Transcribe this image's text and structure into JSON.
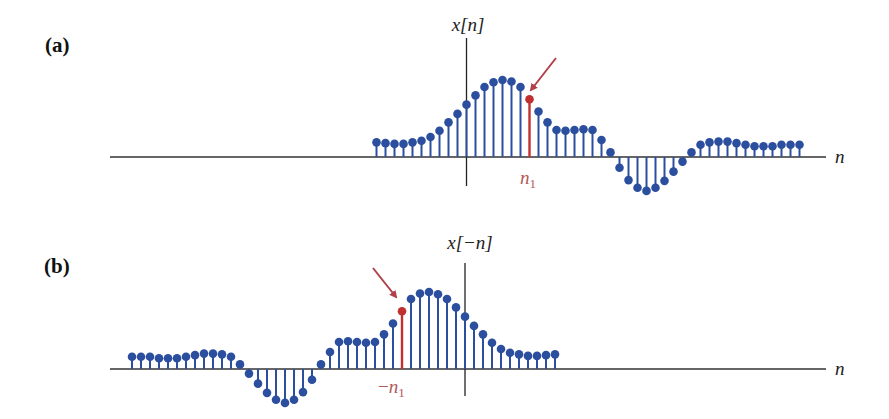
{
  "figure": {
    "panels": [
      {
        "id": "a",
        "label": "(a)",
        "ylabel": "x[n]",
        "xlabel": "n",
        "marker_label": "n",
        "marker_sub": "1",
        "marker_prefix": ""
      },
      {
        "id": "b",
        "label": "(b)",
        "ylabel": "x[−n]",
        "xlabel": "n",
        "marker_label": "n",
        "marker_sub": "1",
        "marker_prefix": "−"
      }
    ],
    "colors": {
      "stem": "#2b4f9e",
      "marker": "#c0302f",
      "axis": "#333333",
      "arrow": "#b0404a",
      "label_marker": "#b05a5a"
    }
  },
  "chart_data": [
    {
      "type": "stem",
      "title": "(a) x[n]",
      "xlabel": "n",
      "ylabel": "x[n]",
      "n": [
        -10,
        -9,
        -8,
        -7,
        -6,
        -5,
        -4,
        -3,
        -2,
        -1,
        0,
        1,
        2,
        3,
        4,
        5,
        6,
        7,
        8,
        9,
        10,
        11,
        12,
        13,
        14,
        15,
        16,
        17,
        18,
        19,
        20,
        21,
        22,
        23,
        24,
        25,
        26,
        27,
        28,
        29,
        30,
        31,
        32,
        33,
        34,
        35,
        36,
        37
      ],
      "values": [
        0.19,
        0.18,
        0.17,
        0.17,
        0.19,
        0.21,
        0.26,
        0.34,
        0.45,
        0.56,
        0.68,
        0.8,
        0.91,
        0.97,
        1.0,
        0.98,
        0.91,
        0.75,
        0.59,
        0.45,
        0.35,
        0.34,
        0.35,
        0.36,
        0.35,
        0.22,
        0.06,
        -0.14,
        -0.3,
        -0.4,
        -0.44,
        -0.4,
        -0.31,
        -0.19,
        -0.06,
        0.06,
        0.16,
        0.19,
        0.2,
        0.2,
        0.18,
        0.16,
        0.14,
        0.14,
        0.14,
        0.16,
        0.16,
        0.16
      ],
      "highlight": {
        "n": 7,
        "label": "n1",
        "color": "#c0302f"
      },
      "grid": false
    },
    {
      "type": "stem",
      "title": "(b) x[-n]",
      "xlabel": "n",
      "ylabel": "x[−n]",
      "n": [
        -37,
        -36,
        -35,
        -34,
        -33,
        -32,
        -31,
        -30,
        -29,
        -28,
        -27,
        -26,
        -25,
        -24,
        -23,
        -22,
        -21,
        -20,
        -19,
        -18,
        -17,
        -16,
        -15,
        -14,
        -13,
        -12,
        -11,
        -10,
        -9,
        -8,
        -7,
        -6,
        -5,
        -4,
        -3,
        -2,
        -1,
        0,
        1,
        2,
        3,
        4,
        5,
        6,
        7,
        8,
        9,
        10
      ],
      "values": [
        0.16,
        0.16,
        0.16,
        0.14,
        0.14,
        0.14,
        0.16,
        0.18,
        0.2,
        0.2,
        0.19,
        0.16,
        0.06,
        -0.06,
        -0.19,
        -0.31,
        -0.4,
        -0.44,
        -0.4,
        -0.3,
        -0.14,
        0.06,
        0.22,
        0.35,
        0.36,
        0.35,
        0.34,
        0.35,
        0.45,
        0.59,
        0.75,
        0.91,
        0.98,
        1.0,
        0.97,
        0.91,
        0.8,
        0.68,
        0.56,
        0.45,
        0.34,
        0.26,
        0.21,
        0.19,
        0.17,
        0.17,
        0.18,
        0.19
      ],
      "highlight": {
        "n": -7,
        "label": "-n1",
        "color": "#c0302f"
      },
      "grid": false
    }
  ]
}
